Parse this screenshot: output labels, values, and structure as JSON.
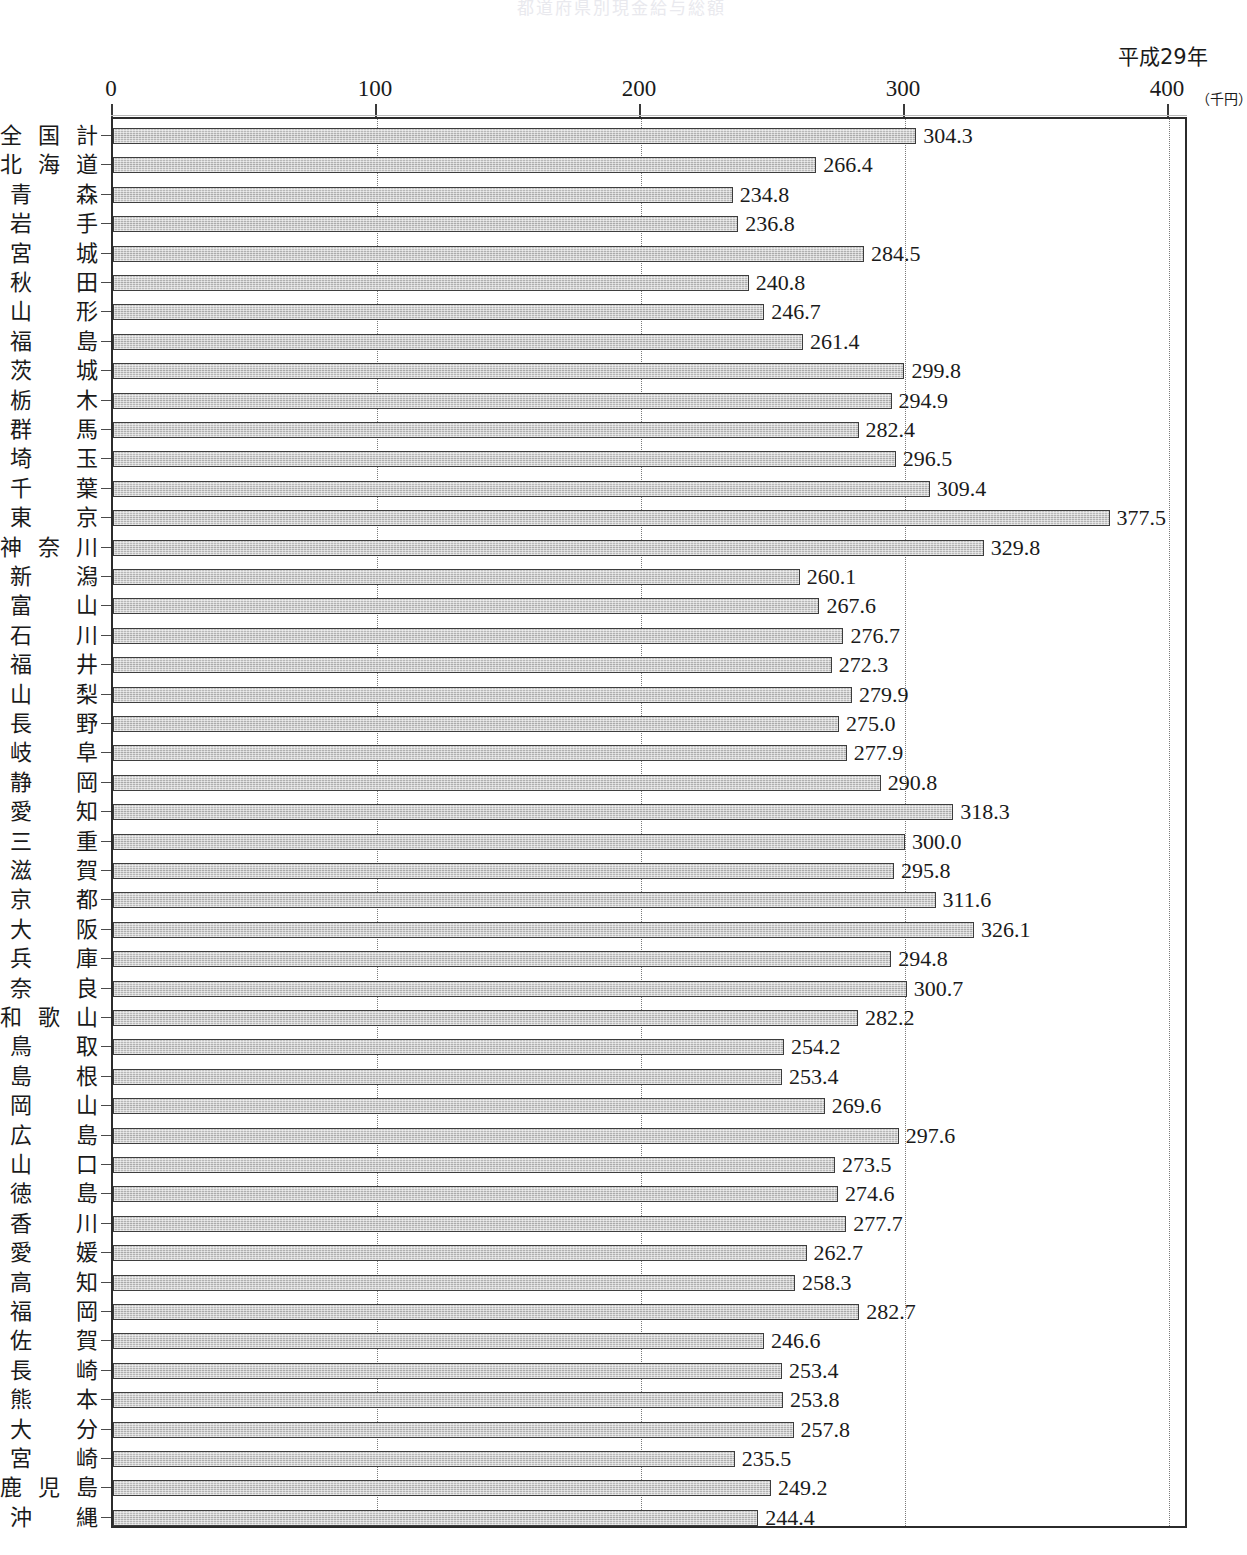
{
  "chart_title": "都道府県別現金給与総額",
  "year_label": "平成29年",
  "unit_label": "（千円）",
  "axis": {
    "ticks": [
      "0",
      "100",
      "200",
      "300",
      "400"
    ],
    "tick_values": [
      0,
      100,
      200,
      300,
      400
    ]
  },
  "chart_data": {
    "type": "bar",
    "orientation": "horizontal",
    "title": "都道府県別現金給与総額",
    "subtitle": "平成29年",
    "xlabel": "（千円）",
    "ylabel": "",
    "xlim": [
      0,
      400
    ],
    "grid": true,
    "legend": "none",
    "categories": [
      "全国計",
      "北海道",
      "青森",
      "岩手",
      "宮城",
      "秋田",
      "山形",
      "福島",
      "茨城",
      "栃木",
      "群馬",
      "埼玉",
      "千葉",
      "東京",
      "神奈川",
      "新潟",
      "富山",
      "石川",
      "福井",
      "山梨",
      "長野",
      "岐阜",
      "静岡",
      "愛知",
      "三重",
      "滋賀",
      "京都",
      "大阪",
      "兵庫",
      "奈良",
      "和歌山",
      "鳥取",
      "島根",
      "岡山",
      "広島",
      "山口",
      "徳島",
      "香川",
      "愛媛",
      "高知",
      "福岡",
      "佐賀",
      "長崎",
      "熊本",
      "大分",
      "宮崎",
      "鹿児島",
      "沖縄"
    ],
    "values": [
      304.3,
      266.4,
      234.8,
      236.8,
      284.5,
      240.8,
      246.7,
      261.4,
      299.8,
      294.9,
      282.4,
      296.5,
      309.4,
      377.5,
      329.8,
      260.1,
      267.6,
      276.7,
      272.3,
      279.9,
      275.0,
      277.9,
      290.8,
      318.3,
      300.0,
      295.8,
      311.6,
      326.1,
      294.8,
      300.7,
      282.2,
      254.2,
      253.4,
      269.6,
      297.6,
      273.5,
      274.6,
      277.7,
      262.7,
      258.3,
      282.7,
      246.6,
      253.4,
      253.8,
      257.8,
      235.5,
      249.2,
      244.4
    ],
    "value_labels": [
      "304.3",
      "266.4",
      "234.8",
      "236.8",
      "284.5",
      "240.8",
      "246.7",
      "261.4",
      "299.8",
      "294.9",
      "282.4",
      "296.5",
      "309.4",
      "377.5",
      "329.8",
      "260.1",
      "267.6",
      "276.7",
      "272.3",
      "279.9",
      "275.0",
      "277.9",
      "290.8",
      "318.3",
      "300.0",
      "295.8",
      "311.6",
      "326.1",
      "294.8",
      "300.7",
      "282.2",
      "254.2",
      "253.4",
      "269.6",
      "297.6",
      "273.5",
      "274.6",
      "277.7",
      "262.7",
      "258.3",
      "282.7",
      "246.6",
      "253.4",
      "253.8",
      "257.8",
      "235.5",
      "249.2",
      "244.4"
    ]
  },
  "colors": {
    "bar_fill": "#b0b0b0",
    "bar_border": "#3d3d3d",
    "frame": "#2b2b2b",
    "gridline": "#7a7a7a",
    "text": "#1a1a1a"
  }
}
